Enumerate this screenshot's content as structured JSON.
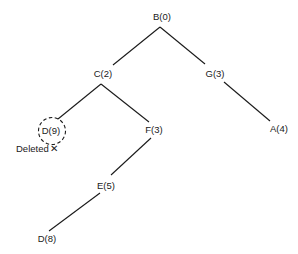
{
  "diagram": {
    "type": "tree",
    "nodes": [
      {
        "id": "B0",
        "label": "B(0)",
        "x": 162,
        "y": 20
      },
      {
        "id": "C2",
        "label": "C(2)",
        "x": 103,
        "y": 77
      },
      {
        "id": "G3",
        "label": "G(3)",
        "x": 215,
        "y": 77
      },
      {
        "id": "D9",
        "label": "D(9)",
        "x": 50,
        "y": 134,
        "deleted": true
      },
      {
        "id": "F3",
        "label": "F(3)",
        "x": 154,
        "y": 133
      },
      {
        "id": "A4",
        "label": "A(4)",
        "x": 279,
        "y": 132
      },
      {
        "id": "E5",
        "label": "E(5)",
        "x": 106,
        "y": 189
      },
      {
        "id": "D8",
        "label": "D(8)",
        "x": 47,
        "y": 242
      }
    ],
    "edges": [
      {
        "from": "B0",
        "to": "C2"
      },
      {
        "from": "B0",
        "to": "G3"
      },
      {
        "from": "C2",
        "to": "D9"
      },
      {
        "from": "C2",
        "to": "F3"
      },
      {
        "from": "G3",
        "to": "A4"
      },
      {
        "from": "F3",
        "to": "E5"
      },
      {
        "from": "E5",
        "to": "D8"
      }
    ],
    "annotation": {
      "text": "Deleted",
      "mark": "✕",
      "target": "D9"
    }
  }
}
